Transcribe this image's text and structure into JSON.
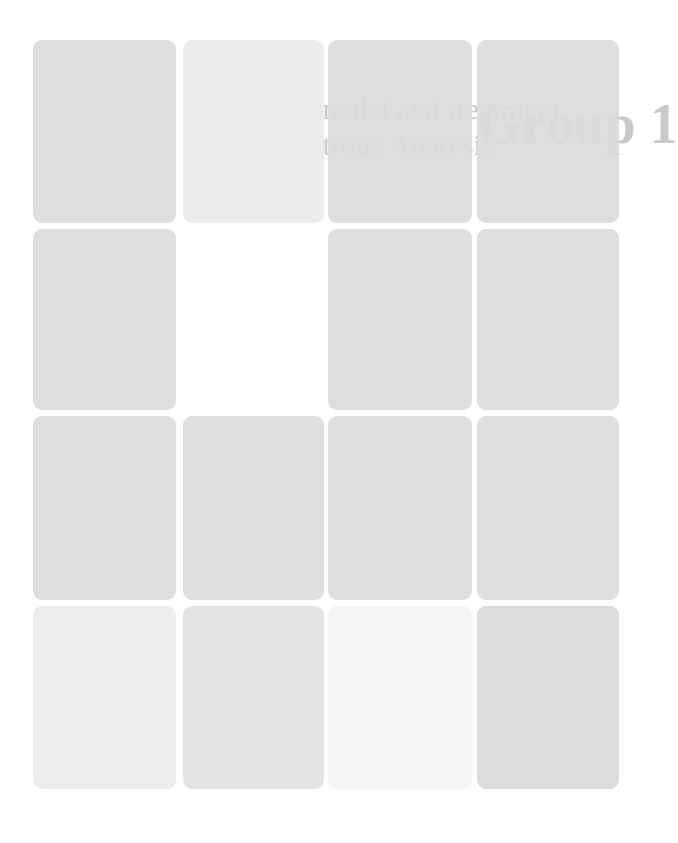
{
  "document": {
    "visible_text_fragments": {
      "title_line1": "...nodel and treatment",
      "title_line2": "...trous Analysis",
      "group_label": "Group 1"
    }
  },
  "tiles": {
    "columns": [
      33,
      183,
      328,
      477
    ],
    "column_widths": [
      143,
      141,
      144,
      142
    ],
    "rows": [
      40,
      229,
      416,
      606
    ],
    "row_heights": [
      183,
      181,
      184,
      183
    ],
    "colors": [
      [
        "#dcdcdc",
        "#ebebeb",
        "#dbdbdb",
        "#dcdcdc"
      ],
      [
        "#dcdcdc",
        "#ffffff",
        "#dbdbdb",
        "#dcdcdc"
      ],
      [
        "#dcdcdc",
        "#dddddd",
        "#dcdcdc",
        "#dcdcdc"
      ],
      [
        "#ececec",
        "#e1e1e1",
        "#f4f4f4",
        "#d9d9d9"
      ]
    ]
  }
}
